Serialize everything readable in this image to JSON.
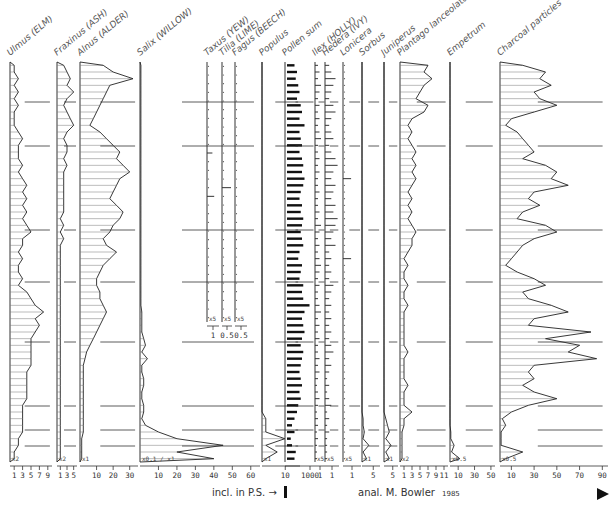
{
  "chart_data": {
    "type": "area",
    "ylabel": "depth (samples, top to bottom)",
    "n_samples": 60,
    "zone_boundaries": [
      0.1,
      0.21,
      0.42,
      0.55,
      0.7,
      0.86,
      0.92,
      0.96
    ],
    "columns": [
      {
        "name": "Ulmus (ELM)",
        "unit": "%",
        "ticks": [
          "1",
          "3",
          "5",
          "7",
          "9"
        ],
        "tick_values": [
          1,
          3,
          5,
          7,
          9
        ],
        "xmax": 10,
        "multiplier": "x2",
        "style": "area",
        "values": [
          1,
          1,
          2,
          1,
          2,
          1,
          2,
          1,
          1,
          1,
          2,
          3,
          2,
          2,
          2,
          3,
          2,
          3,
          4,
          3,
          4,
          3,
          4,
          3,
          4,
          5,
          3,
          3,
          2,
          3,
          2,
          2,
          3,
          2,
          4,
          5,
          6,
          8,
          6,
          7,
          6,
          5,
          5,
          5,
          5,
          5,
          4,
          4,
          4,
          4,
          4,
          3,
          3,
          3,
          3,
          3,
          2,
          2,
          1,
          1
        ]
      },
      {
        "name": "Fraxinus (ASH)",
        "unit": "%",
        "ticks": [
          "1",
          "3",
          "5"
        ],
        "tick_values": [
          1,
          3,
          5
        ],
        "xmax": 6,
        "multiplier": "x2",
        "style": "area",
        "values": [
          2,
          3,
          4,
          3,
          5,
          3,
          2,
          3,
          4,
          5,
          3,
          2,
          3,
          3,
          2,
          3,
          2,
          2,
          2,
          2,
          2,
          2,
          2,
          1,
          2,
          1,
          2,
          1,
          1,
          1,
          1,
          1,
          1,
          1,
          1,
          1,
          1,
          1,
          1,
          1,
          1,
          1,
          1,
          1,
          1,
          1,
          1,
          1,
          1,
          1,
          1,
          1,
          1,
          1,
          1,
          1,
          1,
          1,
          1,
          1
        ]
      },
      {
        "name": "Alnus (ALDER)",
        "unit": "%",
        "ticks": [
          "10",
          "20",
          "30"
        ],
        "tick_values": [
          10,
          20,
          30
        ],
        "xmax": 35,
        "multiplier": "x1",
        "style": "area",
        "values": [
          14,
          20,
          32,
          18,
          16,
          14,
          12,
          10,
          8,
          6,
          12,
          16,
          20,
          24,
          22,
          26,
          30,
          24,
          22,
          20,
          18,
          22,
          26,
          24,
          20,
          18,
          14,
          16,
          22,
          18,
          14,
          12,
          10,
          10,
          12,
          12,
          14,
          16,
          14,
          12,
          10,
          8,
          6,
          4,
          3,
          2,
          2,
          2,
          2,
          2,
          2,
          2,
          2,
          2,
          2,
          2,
          1,
          1,
          1,
          1
        ]
      },
      {
        "name": "Salix (WILLOW)",
        "unit": "%",
        "ticks": [
          "10",
          "20",
          "30",
          "40",
          "50",
          "60"
        ],
        "tick_values": [
          10,
          20,
          30,
          40,
          50,
          60
        ],
        "xmax": 65,
        "multiplier": "x0.1 / x1",
        "style": "area",
        "values": [
          0.5,
          0.5,
          0.5,
          0.5,
          0.5,
          0.5,
          0.5,
          0.5,
          0.5,
          0.5,
          0.5,
          0.5,
          0.5,
          0.5,
          0.5,
          0.5,
          0.5,
          0.5,
          0.5,
          0.5,
          0.5,
          0.5,
          0.5,
          0.5,
          0.5,
          0.5,
          0.5,
          0.5,
          0.5,
          0.5,
          0.5,
          0.5,
          0.5,
          0.5,
          0.5,
          0.5,
          0.5,
          1,
          1,
          1,
          1,
          2,
          3,
          1,
          4,
          1,
          1,
          2,
          2,
          1,
          1,
          2,
          2,
          1,
          3,
          10,
          20,
          45,
          20,
          40
        ]
      },
      {
        "name": "Taxus (YEW)",
        "unit": "%",
        "ticks": [
          "1"
        ],
        "tick_values": [
          1
        ],
        "xmax": 2,
        "multiplier": "x5",
        "style": "dots",
        "rows": 30,
        "values": [
          0,
          0,
          0,
          0,
          0,
          0,
          0,
          0,
          0,
          0,
          0.3,
          0,
          0,
          0,
          0,
          0.4,
          0,
          0,
          0,
          0,
          0,
          0,
          0,
          0,
          0,
          0,
          0,
          0,
          0,
          0
        ]
      },
      {
        "name": "Tilia (LIME)",
        "unit": "%",
        "ticks": [
          "0.5"
        ],
        "tick_values": [
          0.5
        ],
        "xmax": 1,
        "multiplier": "x5",
        "style": "dots",
        "rows": 30,
        "values": [
          0,
          0,
          0,
          0,
          0,
          0,
          0,
          0,
          0,
          0,
          0,
          0,
          0,
          0,
          0.3,
          0,
          0,
          0,
          0,
          0,
          0,
          0,
          0,
          0,
          0,
          0,
          0,
          0,
          0,
          0
        ]
      },
      {
        "name": "Fagus (BEECH)",
        "unit": "%",
        "ticks": [
          "0.5"
        ],
        "tick_values": [
          0.5
        ],
        "xmax": 1,
        "multiplier": "x5",
        "style": "dots",
        "rows": 30,
        "values": [
          0,
          0,
          0,
          0,
          0,
          0,
          0,
          0,
          0,
          0,
          0,
          0,
          0,
          0,
          0,
          0,
          0,
          0,
          0,
          0,
          0,
          0,
          0,
          0,
          0,
          0,
          0,
          0,
          0,
          0
        ]
      },
      {
        "name": "Populus",
        "unit": "%",
        "ticks": [],
        "tick_values": [],
        "xmax": 5,
        "multiplier": "x1",
        "style": "area",
        "values": [
          0,
          0,
          0,
          0,
          0,
          0,
          0,
          0,
          0,
          0,
          0,
          0,
          0,
          0,
          0,
          0,
          0,
          0,
          0,
          0,
          0,
          0,
          0,
          0,
          0,
          0,
          0,
          0,
          0,
          0,
          0,
          0,
          0,
          0,
          0,
          0,
          0,
          0,
          0,
          0,
          0,
          0,
          0,
          0,
          0,
          0,
          0,
          0,
          0,
          0,
          0,
          0,
          0,
          0.5,
          0.5,
          0.5,
          3,
          0.5,
          2,
          0.5
        ]
      },
      {
        "name": "Pollen sum",
        "unit": "grains",
        "ticks": [
          "10",
          "1000"
        ],
        "tick_values": [
          10,
          1000
        ],
        "xmax": 1200,
        "multiplier": "",
        "style": "bars",
        "values": [
          300,
          400,
          350,
          450,
          500,
          400,
          550,
          600,
          500,
          700,
          500,
          550,
          600,
          500,
          600,
          650,
          600,
          700,
          650,
          550,
          500,
          600,
          550,
          650,
          600,
          550,
          600,
          650,
          500,
          450,
          600,
          550,
          500,
          650,
          600,
          650,
          900,
          700,
          600,
          650,
          700,
          600,
          550,
          650,
          600,
          550,
          500,
          550,
          600,
          500,
          550,
          450,
          400,
          300,
          200,
          300,
          150,
          200,
          350,
          300
        ]
      },
      {
        "name": "Ilex (HOLLY)",
        "unit": "%",
        "ticks": [
          "1"
        ],
        "tick_values": [
          1
        ],
        "xmax": 2,
        "multiplier": "x5",
        "style": "dots",
        "values": [
          0.2,
          0.3,
          0.2,
          0.4,
          0.3,
          0.2,
          0.3,
          0.2,
          0.3,
          0.2,
          0.3,
          0.4,
          0.2,
          0.2,
          0.3,
          0.2,
          0.3,
          0.2,
          0.2,
          0.3,
          0.2,
          0.2,
          0.3,
          0.2,
          0.4,
          0.3,
          0.2,
          0.3,
          0.2,
          0.3,
          0.4,
          0.3,
          0.2,
          0.3,
          0.2,
          0.2,
          0.3,
          0.4,
          0.2,
          0.3,
          0.2,
          0.3,
          0.2,
          0.2,
          0.3,
          0.2,
          0.3,
          0.2,
          0.1,
          0.2,
          0.3,
          0.2,
          0.1,
          0.2,
          0.2,
          0.1,
          0.2,
          0.1,
          0.1,
          0.1
        ]
      },
      {
        "name": "Hedera (IVY)",
        "unit": "%",
        "ticks": [
          "1"
        ],
        "tick_values": [
          1
        ],
        "xmax": 2,
        "multiplier": "x5",
        "style": "dots",
        "values": [
          0.2,
          0.3,
          0.5,
          0.4,
          0.3,
          0.2,
          0.4,
          0.5,
          0.3,
          0.2,
          0.3,
          0.4,
          0.2,
          0.3,
          0.5,
          0.6,
          0.4,
          0.3,
          0.5,
          0.4,
          0.3,
          0.5,
          0.4,
          0.6,
          0.5,
          0.4,
          0.3,
          0.5,
          0.2,
          0.3,
          0.2,
          0.3,
          0.2,
          0.4,
          0.3,
          0.2,
          0.3,
          0.2,
          0.3,
          0.2,
          0.3,
          0.2,
          0.3,
          0.4,
          0.2,
          0.3,
          0.2,
          0.1,
          0.2,
          0.1,
          0.2,
          0.3,
          0.1,
          0.2,
          0.1,
          0.2,
          0.1,
          0.1,
          0.1,
          0.1
        ]
      },
      {
        "name": "Lonicera",
        "unit": "%",
        "ticks": [
          "1"
        ],
        "tick_values": [
          1
        ],
        "xmax": 2,
        "multiplier": "x5",
        "style": "dots",
        "values": [
          0,
          0,
          0,
          0,
          0,
          0,
          0,
          0,
          0,
          0,
          0,
          0,
          0,
          0,
          0,
          0,
          0,
          0.3,
          0,
          0,
          0,
          0,
          0,
          0,
          0,
          0,
          0,
          0,
          0,
          0.3,
          0,
          0,
          0,
          0,
          0,
          0,
          0,
          0,
          0,
          0,
          0,
          0,
          0,
          0,
          0,
          0,
          0,
          0,
          0,
          0,
          0,
          0,
          0,
          0,
          0,
          0,
          0,
          0,
          0,
          0
        ]
      },
      {
        "name": "Sorbus",
        "unit": "%",
        "ticks": [
          "5"
        ],
        "tick_values": [
          5
        ],
        "xmax": 8,
        "multiplier": "x1",
        "style": "area",
        "values": [
          0,
          0,
          0,
          0,
          0,
          0,
          0,
          0,
          0,
          0,
          0,
          0,
          0,
          0,
          0,
          0,
          0,
          0,
          0,
          0,
          0,
          0,
          0,
          0,
          0,
          0,
          0,
          0,
          0,
          0,
          0,
          0,
          0,
          0,
          0,
          0,
          0,
          0,
          0,
          0,
          0,
          0,
          0,
          0,
          0,
          0,
          0,
          0,
          0,
          0,
          0,
          0,
          0,
          0.5,
          0.5,
          1,
          0.5,
          3,
          0.5,
          2
        ]
      },
      {
        "name": "Juniperus",
        "unit": "%",
        "ticks": [
          "5"
        ],
        "tick_values": [
          5
        ],
        "xmax": 8,
        "multiplier": "x1",
        "style": "area",
        "values": [
          0,
          0,
          0,
          0,
          0,
          0,
          0,
          0,
          0,
          0,
          0,
          0,
          0,
          0,
          0,
          0,
          0,
          0,
          0,
          0,
          0,
          0,
          0,
          0,
          0,
          0,
          0,
          0,
          0,
          0,
          0,
          0,
          0,
          0,
          0,
          0,
          0,
          0,
          0,
          0,
          0,
          0,
          0,
          0,
          0,
          0,
          0,
          0,
          0,
          0,
          0,
          0,
          0,
          1,
          2,
          3,
          1,
          4,
          1,
          3
        ]
      },
      {
        "name": "Plantago lanceolata",
        "unit": "%",
        "ticks": [
          "1",
          "3",
          "5",
          "7",
          "9",
          "11"
        ],
        "tick_values": [
          1,
          3,
          5,
          7,
          9,
          11
        ],
        "xmax": 12,
        "multiplier": "x2",
        "style": "area",
        "values": [
          7,
          6,
          8,
          6,
          5,
          4,
          7,
          6,
          3,
          2,
          3,
          2,
          3,
          4,
          3,
          4,
          3,
          4,
          3,
          2,
          3,
          2,
          3,
          2,
          3,
          4,
          3,
          3,
          2,
          1,
          2,
          1,
          1,
          2,
          1,
          1,
          2,
          1,
          1,
          1,
          1,
          1,
          1,
          2,
          1,
          1,
          1,
          1,
          2,
          1,
          1,
          1,
          3,
          1,
          1,
          0.5,
          0.5,
          0.5,
          0.5,
          0.5
        ]
      },
      {
        "name": "Empetrum",
        "unit": "%",
        "ticks": [
          "10",
          "30",
          "50"
        ],
        "tick_values": [
          10,
          30,
          50
        ],
        "xmax": 55,
        "multiplier": "x0.5",
        "style": "area",
        "values": [
          0,
          0,
          0,
          0,
          0,
          0,
          0,
          0,
          0,
          0,
          0,
          0,
          0,
          0,
          0,
          0,
          0,
          0,
          0,
          0,
          0,
          0,
          0,
          0,
          0,
          0,
          0,
          0,
          0,
          0,
          0,
          0,
          0,
          0,
          0,
          0,
          0,
          0,
          0,
          0,
          0,
          0,
          0,
          0,
          0,
          0,
          0,
          0,
          0,
          0,
          0,
          0,
          0,
          0,
          0,
          1,
          1,
          5,
          2,
          12
        ]
      },
      {
        "name": "Charcoal particles",
        "unit": "%",
        "ticks": [
          "10",
          "30",
          "50",
          "70",
          "90"
        ],
        "tick_values": [
          10,
          30,
          50,
          70,
          90
        ],
        "xmax": 95,
        "multiplier": "x0.5",
        "style": "area",
        "values": [
          20,
          40,
          35,
          45,
          30,
          35,
          50,
          30,
          10,
          5,
          15,
          20,
          25,
          30,
          20,
          40,
          50,
          45,
          60,
          30,
          25,
          35,
          20,
          15,
          40,
          50,
          30,
          20,
          15,
          10,
          5,
          15,
          30,
          40,
          20,
          25,
          45,
          60,
          30,
          25,
          80,
          40,
          70,
          60,
          85,
          30,
          25,
          30,
          20,
          30,
          50,
          25,
          10,
          2,
          5,
          1,
          1,
          1,
          20,
          5
        ]
      }
    ],
    "footer": {
      "incl_note": "incl. in P.S. →",
      "analyst": "anal. M. Bowler",
      "year": "1985"
    }
  }
}
